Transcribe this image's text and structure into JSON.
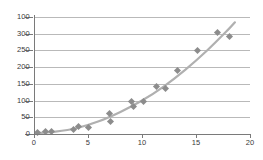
{
  "chart_data": {
    "type": "scatter",
    "title": "",
    "xlabel": "",
    "ylabel": "",
    "xlim": [
      0,
      20
    ],
    "ylim": [
      0,
      350
    ],
    "grid": true,
    "grid_axis": "horizontal",
    "legend": "none",
    "marker_shape": "diamond",
    "marker_color": "#8c8c8c",
    "trendline": {
      "present": true,
      "style": "smooth-quadratic",
      "color": "#b0b0b0",
      "description": "smooth increasing quadratic fit through the points"
    },
    "xticks": [
      0,
      5,
      10,
      15,
      20
    ],
    "xtick_labels": [
      "0",
      "5",
      "10",
      "15",
      "20"
    ],
    "yticks": [
      0,
      50,
      100,
      150,
      200,
      250,
      300,
      350
    ],
    "ytick_labels": [
      "0",
      "50",
      "100",
      "150",
      "200",
      "250",
      "300",
      "100"
    ],
    "points": [
      {
        "x": 0.3,
        "y": 3
      },
      {
        "x": 1.1,
        "y": 6
      },
      {
        "x": 1.6,
        "y": 7
      },
      {
        "x": 3.7,
        "y": 12
      },
      {
        "x": 4.1,
        "y": 23
      },
      {
        "x": 5.0,
        "y": 19
      },
      {
        "x": 7.0,
        "y": 62
      },
      {
        "x": 7.1,
        "y": 38
      },
      {
        "x": 9.0,
        "y": 96
      },
      {
        "x": 9.2,
        "y": 82
      },
      {
        "x": 10.1,
        "y": 97
      },
      {
        "x": 11.3,
        "y": 142
      },
      {
        "x": 12.2,
        "y": 135
      },
      {
        "x": 13.3,
        "y": 189
      },
      {
        "x": 15.1,
        "y": 251
      },
      {
        "x": 17.0,
        "y": 305
      },
      {
        "x": 18.1,
        "y": 293
      }
    ],
    "trend_path": [
      {
        "x": 0.0,
        "y": 2
      },
      {
        "x": 2.0,
        "y": 7
      },
      {
        "x": 4.0,
        "y": 18
      },
      {
        "x": 6.0,
        "y": 38
      },
      {
        "x": 8.0,
        "y": 66
      },
      {
        "x": 10.0,
        "y": 100
      },
      {
        "x": 12.0,
        "y": 142
      },
      {
        "x": 14.0,
        "y": 192
      },
      {
        "x": 16.0,
        "y": 249
      },
      {
        "x": 18.0,
        "y": 313
      },
      {
        "x": 18.6,
        "y": 334
      }
    ]
  }
}
